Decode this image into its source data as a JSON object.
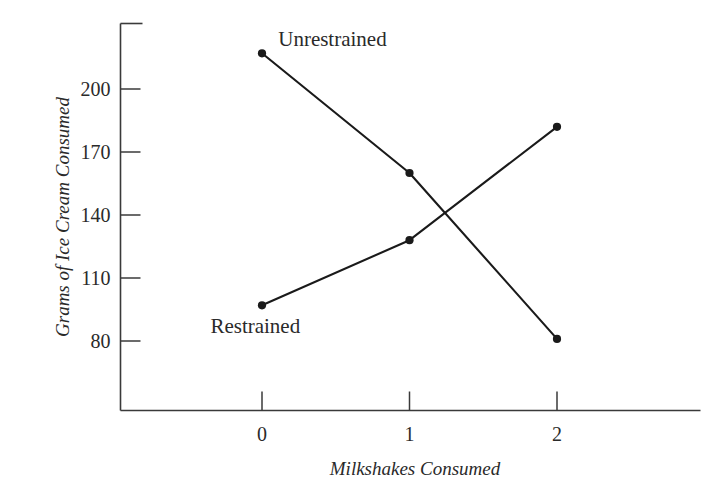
{
  "chart_data": {
    "type": "line",
    "title": "",
    "xlabel": "Milkshakes Consumed",
    "ylabel": "Grams of Ice Cream Consumed",
    "x": [
      0,
      1,
      2
    ],
    "xtick_labels": [
      "0",
      "1",
      "2"
    ],
    "ytick_labels": [
      "200",
      "170",
      "140",
      "110",
      "80"
    ],
    "ytick_values": [
      200,
      170,
      140,
      110,
      80
    ],
    "ylim": [
      65,
      232
    ],
    "xlim": [
      -0.95,
      2.95
    ],
    "grid": false,
    "legend": "inline-annotations",
    "series": [
      {
        "name": "Unrestrained",
        "values": [
          217,
          160,
          81
        ],
        "color": "#1a1a1a",
        "label_x": 0.11,
        "label_y": 224
      },
      {
        "name": "Restrained",
        "values": [
          97,
          128,
          182
        ],
        "color": "#1a1a1a",
        "label_x": -0.35,
        "label_y": 87
      }
    ],
    "marker": "filled-circle",
    "axis_color": "#3a3a3a"
  }
}
